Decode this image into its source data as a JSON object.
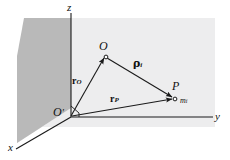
{
  "figure": {
    "caption": "",
    "colors": {
      "background": "#ffffff",
      "ground_plane": "#ededee",
      "vertical_plane": "#b9b9b9",
      "line": "#1a1a1a",
      "text": "#111111"
    },
    "axes": [
      {
        "id": "z",
        "label": "z",
        "name": "z-axis"
      },
      {
        "id": "y",
        "label": "y",
        "name": "y-axis"
      },
      {
        "id": "x",
        "label": "x",
        "name": "x-axis"
      }
    ],
    "points": [
      {
        "id": "O_prime",
        "label": "O",
        "prime": "′",
        "name": "origin-point"
      },
      {
        "id": "O",
        "label": "O",
        "name": "point-o"
      },
      {
        "id": "P",
        "label": "P",
        "name": "point-p"
      }
    ],
    "annotations": [
      {
        "id": "m_i",
        "label": "m",
        "sub": "i",
        "name": "mass-label"
      }
    ],
    "vectors": [
      {
        "id": "r_O",
        "label": "r",
        "sub": "O",
        "name": "vector-r-o",
        "from": "O_prime",
        "to": "O"
      },
      {
        "id": "r_P",
        "label": "r",
        "sub": "P",
        "name": "vector-r-p",
        "from": "O_prime",
        "to": "P"
      },
      {
        "id": "rho_i",
        "label": "ρ",
        "sub": "i",
        "name": "vector-rho-i",
        "from": "O",
        "to": "P"
      }
    ]
  }
}
